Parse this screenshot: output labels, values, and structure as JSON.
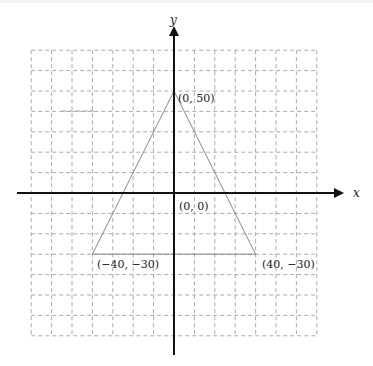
{
  "diagram": {
    "type": "coordinate-plane",
    "axes": {
      "x_label": "x",
      "y_label": "y",
      "origin_label": "(0, 0)"
    },
    "grid": {
      "spacing_units": 10,
      "x_range": [
        -70,
        70
      ],
      "y_range": [
        -70,
        70
      ],
      "style": "dashed",
      "color": "#aaaaaa"
    },
    "triangle": {
      "color": "#888888",
      "vertices": [
        {
          "name": "apex",
          "x": 0,
          "y": 50,
          "label": "(0, 50)"
        },
        {
          "name": "bottom-left",
          "x": -40,
          "y": -30,
          "label": "(−40, −30)"
        },
        {
          "name": "bottom-right",
          "x": 40,
          "y": -30,
          "label": "(40, −30)"
        }
      ]
    },
    "colors": {
      "axis": "#111111",
      "background": "#ffffff"
    }
  }
}
